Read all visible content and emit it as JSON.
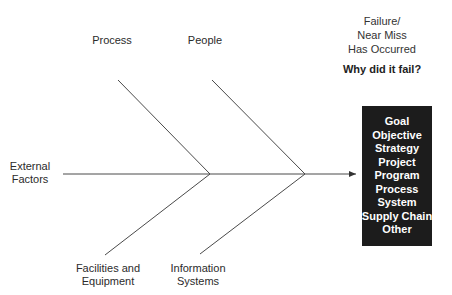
{
  "header": {
    "failure_lines": [
      "Failure/",
      "Near Miss",
      "Has Occurred"
    ],
    "question": "Why did it fail?"
  },
  "causes": {
    "process": "Process",
    "people": "People",
    "external": [
      "External",
      "Factors"
    ],
    "facilities": [
      "Facilities and",
      "Equipment"
    ],
    "information": [
      "Information",
      "Systems"
    ]
  },
  "effect_box": {
    "items": [
      "Goal",
      "Objective",
      "Strategy",
      "Project",
      "Program",
      "Process",
      "System",
      "Supply Chain",
      "Other"
    ],
    "background": "#1c1c1c",
    "text_color": "#ffffff"
  },
  "colors": {
    "line": "#4a4a4a"
  }
}
